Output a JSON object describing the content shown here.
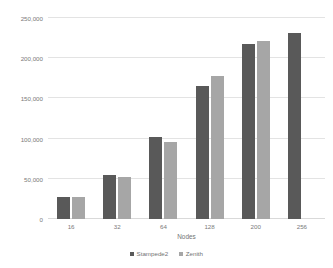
{
  "chart_data": {
    "type": "bar",
    "title": "",
    "xlabel": "Nodes",
    "ylabel": "Throughput (tokens per second)",
    "categories": [
      "16",
      "32",
      "64",
      "128",
      "200",
      "256"
    ],
    "series": [
      {
        "name": "Stampede2",
        "color": "#595959",
        "values": [
          28000,
          55000,
          102000,
          165000,
          218000,
          231000
        ]
      },
      {
        "name": "Zenith",
        "color": "#a6a6a6",
        "values": [
          27000,
          52000,
          96000,
          178000,
          222000,
          null
        ]
      }
    ],
    "ylim": [
      0,
      250000
    ],
    "ytick_values": [
      0,
      50000,
      100000,
      150000,
      200000,
      250000
    ],
    "ytick_labels": [
      "0",
      "50,000",
      "100,000",
      "150,000",
      "200,000",
      "250,000"
    ],
    "grid": "horizontal",
    "legend_position": "bottom"
  }
}
